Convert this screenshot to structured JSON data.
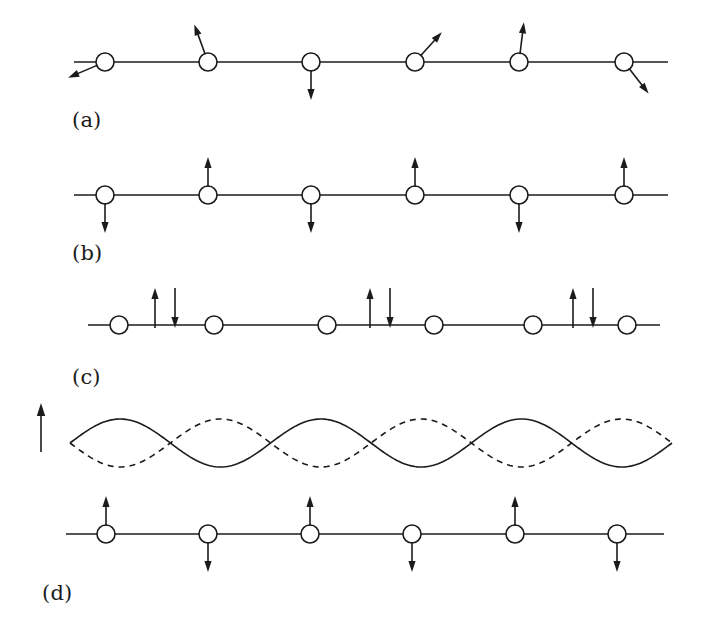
{
  "figure": {
    "width": 701,
    "height": 627,
    "background_color": "#ffffff",
    "ink_color": "#1b1b1b",
    "line_width": 1.6
  },
  "panels": [
    {
      "id": "a",
      "label": "(a)",
      "label_x": 72,
      "label_y": 110,
      "caption_hint": "paramagnetic / disordered spins, random tilt directions",
      "chain": {
        "line_y": 62,
        "line_x_start": 74,
        "line_x_end": 668,
        "site_radius": 9,
        "site_x": [
          105,
          208,
          311,
          415,
          519,
          624
        ],
        "arrows": [
          {
            "site_index": 0,
            "angle_deg": -157,
            "length": 40,
            "label": "down-left-spin-arrow"
          },
          {
            "site_index": 1,
            "angle_deg": 110,
            "length": 40,
            "label": "up-left-spin-arrow"
          },
          {
            "site_index": 2,
            "angle_deg": -90,
            "length": 38,
            "label": "down-spin-arrow"
          },
          {
            "site_index": 3,
            "angle_deg": 48,
            "length": 40,
            "label": "up-right-spin-arrow"
          },
          {
            "site_index": 4,
            "angle_deg": 83,
            "length": 40,
            "label": "up-spin-arrow"
          },
          {
            "site_index": 5,
            "angle_deg": -52,
            "length": 40,
            "label": "down-right-spin-arrow"
          }
        ]
      }
    },
    {
      "id": "b",
      "label": "(b)",
      "label_x": 72,
      "label_y": 243,
      "caption_hint": "antiferromagnetic ground state, alternating up and down spins",
      "chain": {
        "line_y": 195,
        "line_x_start": 74,
        "line_x_end": 668,
        "site_radius": 9,
        "site_x": [
          105,
          208,
          311,
          415,
          519,
          624
        ],
        "arrows": [
          {
            "site_index": 0,
            "angle_deg": -90,
            "length": 38,
            "label": "down-spin-arrow"
          },
          {
            "site_index": 1,
            "angle_deg": 90,
            "length": 38,
            "label": "up-spin-arrow"
          },
          {
            "site_index": 2,
            "angle_deg": -90,
            "length": 38,
            "label": "down-spin-arrow"
          },
          {
            "site_index": 3,
            "angle_deg": 90,
            "length": 38,
            "label": "up-spin-arrow"
          },
          {
            "site_index": 4,
            "angle_deg": -90,
            "length": 38,
            "label": "down-spin-arrow"
          },
          {
            "site_index": 5,
            "angle_deg": 90,
            "length": 38,
            "label": "up-spin-arrow"
          }
        ]
      }
    },
    {
      "id": "c",
      "label": "(c)",
      "label_x": 72,
      "label_y": 367,
      "caption_hint": "localised spin flips: up-down arrow pairs between sites",
      "chain": {
        "line_y": 325,
        "line_x_start": 88,
        "line_x_end": 660,
        "site_radius": 9,
        "site_x": [
          119,
          214,
          327,
          434,
          533,
          627
        ],
        "arrows": [],
        "arrow_pairs": [
          {
            "center_x": 165,
            "up_dx": -10,
            "down_dx": 10,
            "top_y": 288,
            "bottom_y": 328,
            "label": "spin-flip-pair"
          },
          {
            "center_x": 380,
            "up_dx": -10,
            "down_dx": 10,
            "top_y": 288,
            "bottom_y": 328,
            "label": "spin-flip-pair"
          },
          {
            "center_x": 583,
            "up_dx": -10,
            "down_dx": 10,
            "top_y": 288,
            "bottom_y": 328,
            "label": "spin-flip-pair"
          }
        ]
      }
    },
    {
      "id": "d",
      "label": "(d)",
      "label_x": 42,
      "label_y": 583,
      "caption_hint": "spin wave: two antiphase sublattice envelopes above alternating chain",
      "axis_arrow": {
        "x": 41,
        "y_tail": 452,
        "y_head": 403,
        "label": "amplitude-axis-arrow"
      },
      "waves": {
        "x_start": 70,
        "x_end": 672,
        "mid_y": 443,
        "amplitude": 24,
        "periods": 3,
        "solid": {
          "phase_deg": 0,
          "style": "solid",
          "label": "sublattice-A-wave"
        },
        "dashed": {
          "phase_deg": 180,
          "style": "dashed",
          "dash_pattern": "6,5",
          "label": "sublattice-B-wave"
        }
      },
      "chain": {
        "line_y": 534,
        "line_x_start": 66,
        "line_x_end": 664,
        "site_radius": 9,
        "site_x": [
          106,
          208,
          310,
          412,
          515,
          617
        ],
        "arrows": [
          {
            "site_index": 0,
            "angle_deg": 90,
            "length": 38,
            "label": "up-spin-arrow"
          },
          {
            "site_index": 1,
            "angle_deg": -90,
            "length": 38,
            "label": "down-spin-arrow"
          },
          {
            "site_index": 2,
            "angle_deg": 90,
            "length": 38,
            "label": "up-spin-arrow"
          },
          {
            "site_index": 3,
            "angle_deg": -90,
            "length": 38,
            "label": "down-spin-arrow"
          },
          {
            "site_index": 4,
            "angle_deg": 90,
            "length": 38,
            "label": "up-spin-arrow"
          },
          {
            "site_index": 5,
            "angle_deg": -90,
            "length": 38,
            "label": "down-spin-arrow"
          }
        ]
      }
    }
  ]
}
